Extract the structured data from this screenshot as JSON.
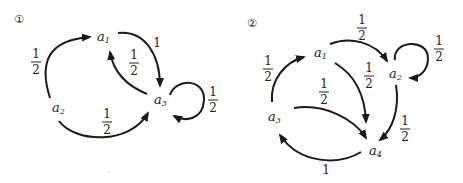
{
  "diagrams": [
    {
      "label": "1",
      "marker": "①",
      "nodes": [
        {
          "id": "a1",
          "base": "a",
          "sub": "1"
        },
        {
          "id": "a2",
          "base": "a",
          "sub": "2"
        },
        {
          "id": "a3",
          "base": "a",
          "sub": "3"
        }
      ],
      "edges": [
        {
          "from": "a2",
          "to": "a1",
          "weight_num": "1",
          "weight_den": "2"
        },
        {
          "from": "a1",
          "to": "a3",
          "weight": "1"
        },
        {
          "from": "a3",
          "to": "a1",
          "weight_num": "1",
          "weight_den": "2"
        },
        {
          "from": "a3",
          "to": "a3",
          "weight_num": "1",
          "weight_den": "2"
        },
        {
          "from": "a2",
          "to": "a3",
          "weight_num": "1",
          "weight_den": "2"
        }
      ]
    },
    {
      "label": "2",
      "marker": "②",
      "nodes": [
        {
          "id": "a1",
          "base": "a",
          "sub": "1"
        },
        {
          "id": "a2",
          "base": "a",
          "sub": "2"
        },
        {
          "id": "a3",
          "base": "a",
          "sub": "3"
        },
        {
          "id": "a4",
          "base": "a",
          "sub": "4"
        }
      ],
      "edges": [
        {
          "from": "a1",
          "to": "a2",
          "weight_num": "1",
          "weight_den": "2"
        },
        {
          "from": "a2",
          "to": "a2",
          "weight_num": "1",
          "weight_den": "2"
        },
        {
          "from": "a3",
          "to": "a1",
          "weight_num": "1",
          "weight_den": "2"
        },
        {
          "from": "a1",
          "to": "a4",
          "weight_num": "1",
          "weight_den": "2"
        },
        {
          "from": "a3",
          "to": "a4",
          "weight_num": "1",
          "weight_den": "2"
        },
        {
          "from": "a2",
          "to": "a4",
          "weight_num": "1",
          "weight_den": "2"
        },
        {
          "from": "a4",
          "to": "a3",
          "weight": "1"
        }
      ]
    }
  ]
}
